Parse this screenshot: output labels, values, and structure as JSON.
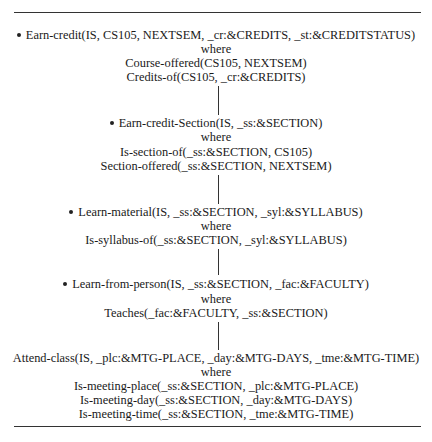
{
  "diagram": {
    "type": "goal-decomposition-chain",
    "nodes": [
      {
        "bullet": true,
        "head": "Earn-credit(IS, CS105, NEXTSEM, _cr:&CREDITS, _st:&CREDITSTATUS)",
        "where": "where",
        "conditions": [
          "Course-offered(CS105, NEXTSEM)",
          "Credits-of(CS105, _cr:&CREDITS)"
        ]
      },
      {
        "bullet": true,
        "head": "Earn-credit-Section(IS, _ss:&SECTION)",
        "where": "where",
        "conditions": [
          "Is-section-of(_ss:&SECTION, CS105)",
          "Section-offered(_ss:&SECTION, NEXTSEM)"
        ]
      },
      {
        "bullet": true,
        "head": "Learn-material(IS, _ss:&SECTION, _syl:&SYLLABUS)",
        "where": "where",
        "conditions": [
          "Is-syllabus-of(_ss:&SECTION, _syl:&SYLLABUS)"
        ]
      },
      {
        "bullet": true,
        "head": "Learn-from-person(IS, _ss:&SECTION, _fac:&FACULTY)",
        "where": "where",
        "conditions": [
          "Teaches(_fac:&FACULTY, _ss:&SECTION)"
        ]
      },
      {
        "bullet": false,
        "head": "Attend-class(IS, _plc:&MTG-PLACE, _day:&MTG-DAYS, _tme:&MTG-TIME)",
        "where": "where",
        "conditions": [
          "Is-meeting-place(_ss:&SECTION, _plc:&MTG-PLACE)",
          "Is-meeting-day(_ss:&SECTION, _day:&MTG-DAYS)",
          "Is-meeting-time(_ss:&SECTION, _tme:&MTG-TIME)"
        ]
      }
    ]
  }
}
